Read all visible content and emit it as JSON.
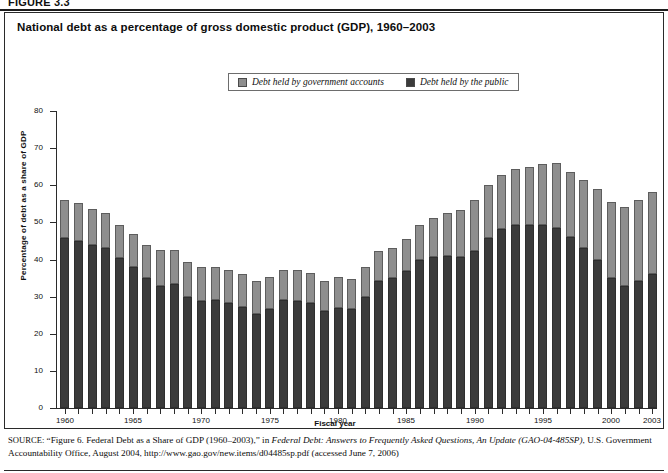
{
  "figure": {
    "label": "FIGURE 3.3"
  },
  "chart_title": "National debt as a percentage of gross domestic product (GDP), 1960–2003",
  "legend": {
    "items": [
      {
        "label": "Debt held by government accounts",
        "color": "#8e8e8e",
        "key": "government"
      },
      {
        "label": "Debt held by the public",
        "color": "#3b3b3b",
        "key": "public"
      }
    ]
  },
  "axes": {
    "y_title": "Percentage of debt as a share of GDP",
    "x_title": "Fiscal year",
    "y_ticks": [
      0,
      10,
      20,
      30,
      40,
      50,
      60,
      70,
      80
    ],
    "x_tick_labels": [
      "1960",
      "1965",
      "1970",
      "1975",
      "1980",
      "1985",
      "1990",
      "1995",
      "2000",
      "2003"
    ]
  },
  "source": {
    "prefix": "SOURCE:",
    "line1_a": " “Figure 6. Federal Debt as a Share of GDP (1960–2003),” in ",
    "line1_italic": "Federal Debt: Answers to Frequently Asked Questions, An Update (GAO-04-485SP)",
    "line1_b": ",",
    "line2": "U.S. Government Accountability Office, August 2004, http://www.gao.gov/new.items/d04485sp.pdf (accessed June 7, 2006)"
  },
  "chart_data": {
    "type": "bar",
    "subtype": "stacked",
    "title": "National debt as a percentage of gross domestic product (GDP), 1960–2003",
    "xlabel": "Fiscal year",
    "ylabel": "Percentage of debt as a share of GDP",
    "ylim": [
      0,
      80
    ],
    "ytick_step": 10,
    "grid": false,
    "legend_position": "top-center",
    "categories": [
      "1960",
      "1961",
      "1962",
      "1963",
      "1964",
      "1965",
      "1966",
      "1967",
      "1968",
      "1969",
      "1970",
      "1971",
      "1972",
      "1973",
      "1974",
      "1975",
      "1976",
      "1977",
      "1978",
      "1979",
      "1980",
      "1981",
      "1982",
      "1983",
      "1984",
      "1985",
      "1986",
      "1987",
      "1988",
      "1989",
      "1990",
      "1991",
      "1992",
      "1993",
      "1994",
      "1995",
      "1996",
      "1997",
      "1998",
      "1999",
      "2000",
      "2001",
      "2002",
      "2003"
    ],
    "series": [
      {
        "name": "Debt held by the public",
        "color": "#3b3b3b",
        "values": [
          45.7,
          45.0,
          44.0,
          43.0,
          40.3,
          38.0,
          35.0,
          33.0,
          33.4,
          30.0,
          28.7,
          29.1,
          28.4,
          27.2,
          25.3,
          26.8,
          29.0,
          28.9,
          28.2,
          26.0,
          27.0,
          26.7,
          29.8,
          34.1,
          35.1,
          37.0,
          39.8,
          40.6,
          40.9,
          40.6,
          42.4,
          45.9,
          48.1,
          49.4,
          49.3,
          49.2,
          48.5,
          46.1,
          43.1,
          39.8,
          35.1,
          33.0,
          34.1,
          36.1
        ]
      },
      {
        "name": "Debt held by government accounts",
        "color": "#8e8e8e",
        "values": [
          10.4,
          10.1,
          9.7,
          9.6,
          9.1,
          8.8,
          8.9,
          9.6,
          9.2,
          9.4,
          9.3,
          9.0,
          8.7,
          8.8,
          8.9,
          8.5,
          8.3,
          8.2,
          8.3,
          8.2,
          8.2,
          8.1,
          8.1,
          8.2,
          8.0,
          8.6,
          9.6,
          10.5,
          11.5,
          12.8,
          13.7,
          14.3,
          14.7,
          15.1,
          15.7,
          16.5,
          17.4,
          17.6,
          18.4,
          19.2,
          20.5,
          21.2,
          21.9,
          22.0
        ]
      }
    ],
    "totals": [
      56.1,
      55.1,
      53.7,
      52.6,
      49.4,
      46.8,
      43.9,
      42.6,
      42.6,
      39.4,
      38.0,
      38.1,
      37.1,
      36.0,
      34.2,
      35.3,
      37.3,
      37.1,
      36.5,
      34.2,
      35.2,
      34.8,
      37.9,
      42.3,
      43.1,
      45.6,
      49.4,
      51.1,
      52.4,
      53.4,
      56.1,
      60.2,
      62.8,
      64.5,
      65.0,
      65.7,
      65.9,
      63.7,
      61.5,
      59.0,
      55.6,
      54.2,
      56.0,
      58.1
    ]
  }
}
